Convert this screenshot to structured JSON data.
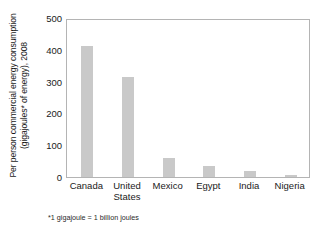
{
  "chart_data": {
    "type": "bar",
    "title": "",
    "subtitle": "",
    "categories": [
      "Canada",
      "United States",
      "Mexico",
      "Egypt",
      "India",
      "Nigeria"
    ],
    "category_lines": [
      [
        "Canada"
      ],
      [
        "United",
        "States"
      ],
      [
        "Mexico"
      ],
      [
        "Egypt"
      ],
      [
        "India"
      ],
      [
        "Nigeria"
      ]
    ],
    "values": [
      413,
      316,
      60,
      35,
      18,
      7
    ],
    "xlabel": "",
    "ylabel": "Per person commercial energy consumption (gigajoules* of energy), 2008",
    "ylabel_lines": [
      "Per person commercial energy consumption",
      "(gigajoules* of energy), 2008"
    ],
    "ylim": [
      0,
      500
    ],
    "yticks": [
      0,
      100,
      200,
      300,
      400,
      500
    ],
    "ytick_labels": [
      "0",
      "100",
      "200",
      "300",
      "400",
      "500"
    ],
    "grid": false,
    "legend": null,
    "legend_position": "none",
    "bar_color": "#c9c9c9",
    "axis_color": "#b4b4b4",
    "plot_background": "#ffffff",
    "annotations": [
      "*1 gigajoule = 1 billion joules"
    ],
    "footnote": "*1 gigajoule = 1 billion joules",
    "units": "gigajoules per person"
  }
}
